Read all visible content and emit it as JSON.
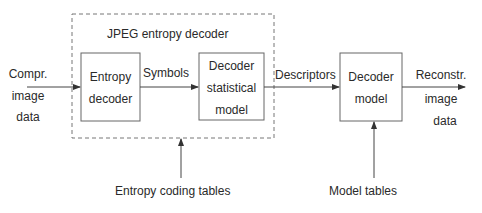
{
  "diagram": {
    "container": {
      "label": "JPEG entropy decoder",
      "style": "dashed"
    },
    "nodes": [
      {
        "id": "entropy_decoder",
        "lines": [
          "Entropy",
          "decoder"
        ]
      },
      {
        "id": "statistical_model",
        "lines": [
          "Decoder",
          "statistical",
          "model"
        ]
      },
      {
        "id": "decoder_model",
        "lines": [
          "Decoder",
          "model"
        ]
      }
    ],
    "edges": [
      {
        "from": "input",
        "to": "entropy_decoder",
        "lines": [
          "Compr.",
          "image",
          "data"
        ]
      },
      {
        "from": "entropy_decoder",
        "to": "statistical_model",
        "label": "Symbols"
      },
      {
        "from": "statistical_model",
        "to": "decoder_model",
        "label": "Descriptors"
      },
      {
        "from": "decoder_model",
        "to": "output",
        "lines": [
          "Reconstr.",
          "image",
          "data"
        ]
      },
      {
        "from": "entropy_coding_tables",
        "to": "container",
        "label": "Entropy coding tables"
      },
      {
        "from": "model_tables",
        "to": "decoder_model",
        "label": "Model tables"
      }
    ],
    "colors": {
      "line": "#555555",
      "text": "#2a2a2a",
      "dash": "#777777"
    }
  }
}
